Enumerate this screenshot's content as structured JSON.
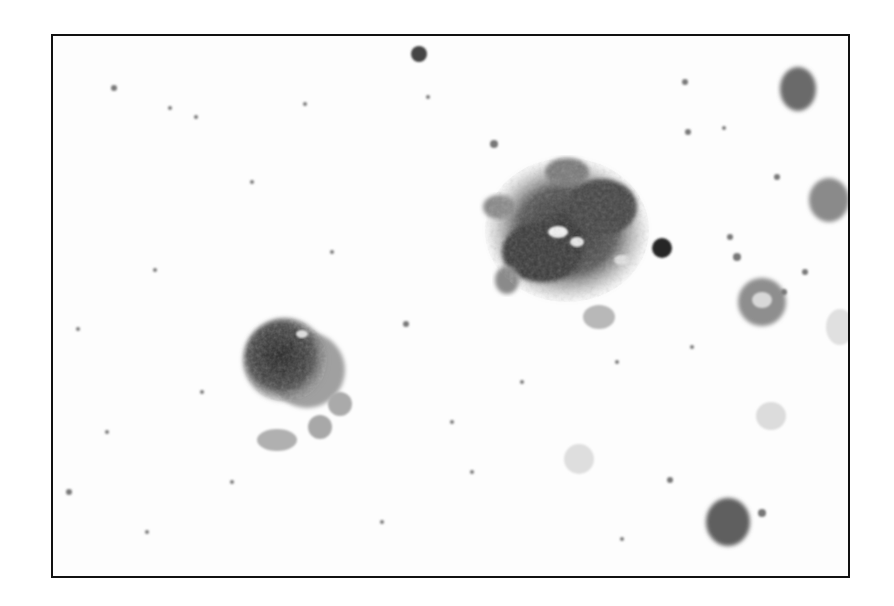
{
  "image": {
    "kind": "grayscale light micrograph",
    "description": "Microscopy field showing two large granular cells (one central-right clump, one left-lower round cell) with scattered smaller cells, pale red-cell ghosts and fine debris on a white background, enclosed in a thin black frame.",
    "frame": {
      "x": 51,
      "y": 34,
      "width": 798,
      "height": 543,
      "stroke": "#111111"
    },
    "colors": {
      "background": "#ffffff",
      "field": "#fdfdfd",
      "dark": "#2a2a2a",
      "mid": "#7a7a7a",
      "light": "#c8c8c8"
    },
    "features": [
      {
        "name": "large-granular-clump",
        "cx": 565,
        "cy": 228,
        "r": 75
      },
      {
        "name": "round-granular-cell",
        "cx": 288,
        "cy": 360,
        "r": 46
      },
      {
        "name": "dark-small-cell-top-right",
        "cx": 796,
        "cy": 86,
        "r": 20
      },
      {
        "name": "dark-small-cell-bottom-right",
        "cx": 726,
        "cy": 520,
        "r": 22
      },
      {
        "name": "dark-dot-center",
        "cx": 660,
        "cy": 246,
        "r": 10
      },
      {
        "name": "dark-dot-top",
        "cx": 417,
        "cy": 52,
        "r": 8
      }
    ]
  }
}
